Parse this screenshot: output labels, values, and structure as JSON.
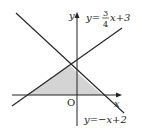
{
  "diagram": {
    "axes": {
      "x_label": "x",
      "y_label": "y",
      "origin_label": "O"
    },
    "lines": [
      {
        "name": "rising",
        "equation_prefix": "y=",
        "coef_num": "3",
        "coef_den": "4",
        "equation_suffix": "x+3"
      },
      {
        "name": "falling",
        "equation": "y=−x+2"
      }
    ],
    "shaded_region": "triangle bounded by both lines and the x-axis",
    "colors": {
      "line": "#222222",
      "shade": "#d4d4d4",
      "background": "#ffffff"
    }
  }
}
